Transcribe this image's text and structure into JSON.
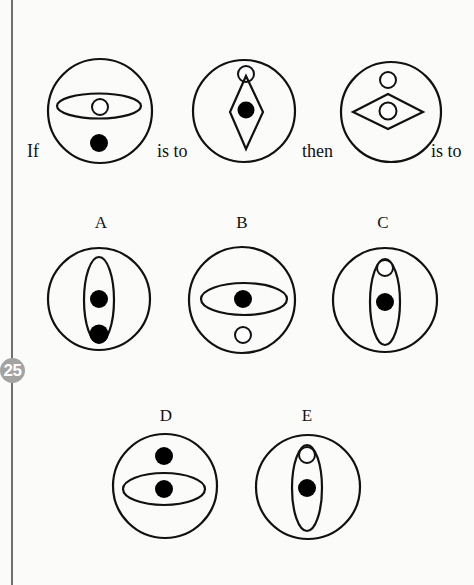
{
  "page": {
    "page_number": "25",
    "background": "#fbfbfa",
    "margin_line_color": "#707070",
    "badge_color": "#a3a3a3"
  },
  "question": {
    "words": {
      "if": "If",
      "is_to_1": "is to",
      "then": "then",
      "is_to_2": "is to"
    },
    "figures": [
      {
        "id": "figure-1",
        "description": "Large circle containing a horizontal ellipse with a small white circle inside; black dot below the ellipse"
      },
      {
        "id": "figure-2",
        "description": "Large circle containing a vertical diamond with a black dot inside; small white circle at the diamond's top tip"
      },
      {
        "id": "figure-3",
        "description": "Large circle containing a horizontal diamond with a small white circle inside; another small white circle above the diamond"
      }
    ]
  },
  "options": [
    {
      "label": "A",
      "description": "Vertical ellipse containing two black dots"
    },
    {
      "label": "B",
      "description": "Horizontal ellipse with black dot inside; small white circle below"
    },
    {
      "label": "C",
      "description": "Vertical ellipse with small white circle at top and black dot in center"
    },
    {
      "label": "D",
      "description": "Horizontal ellipse with black dot inside; black dot above"
    },
    {
      "label": "E",
      "description": "Vertical ellipse with small white circle at top and black dot in center"
    }
  ]
}
